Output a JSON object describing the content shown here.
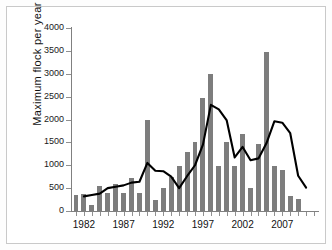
{
  "figure": {
    "background": "#ffffff",
    "bar_color": "#7d7d7d",
    "line_color": "#000000",
    "axis_color": "#808080"
  },
  "chart_data": {
    "type": "bar",
    "title": "",
    "xlabel": "",
    "ylabel": "Maximum flock per year",
    "ylim": [
      0,
      4000
    ],
    "ytick_step": 500,
    "yticks": [
      0,
      500,
      1000,
      1500,
      2000,
      2500,
      3000,
      3500,
      4000
    ],
    "ytick_labels": [
      "0",
      "500",
      "1000",
      "1500",
      "2000",
      "2500",
      "3000",
      "3500",
      "4000"
    ],
    "grid": false,
    "legend": null,
    "xlim": [
      1981,
      2011
    ],
    "categories": [
      1981,
      1982,
      1983,
      1984,
      1985,
      1986,
      1987,
      1988,
      1989,
      1990,
      1991,
      1992,
      1993,
      1994,
      1995,
      1996,
      1997,
      1998,
      1999,
      2000,
      2001,
      2002,
      2003,
      2004,
      2005,
      2006,
      2007,
      2008,
      2009,
      2010,
      2011
    ],
    "xtick_labels": [
      "1982",
      "1987",
      "1992",
      "1997",
      "2002",
      "2007"
    ],
    "xtick_values": [
      1982,
      1987,
      1992,
      1997,
      2002,
      2007
    ],
    "series": [
      {
        "name": "Maximum flock per year",
        "type": "bar",
        "color": "#7d7d7d",
        "values": [
          360,
          380,
          140,
          545,
          400,
          600,
          400,
          730,
          390,
          1990,
          245,
          500,
          740,
          990,
          1290,
          1500,
          2480,
          3000,
          990,
          1510,
          990,
          1690,
          510,
          1460,
          3480,
          990,
          900,
          330,
          255,
          0,
          0
        ]
      },
      {
        "name": "Smoothed trend",
        "type": "line",
        "color": "#000000",
        "values": [
          null,
          320,
          350,
          380,
          500,
          530,
          560,
          620,
          640,
          1050,
          880,
          870,
          750,
          500,
          760,
          1000,
          1450,
          2320,
          2220,
          1980,
          1170,
          1400,
          1110,
          1150,
          1480,
          1960,
          1930,
          1700,
          770,
          510,
          null
        ]
      }
    ]
  }
}
